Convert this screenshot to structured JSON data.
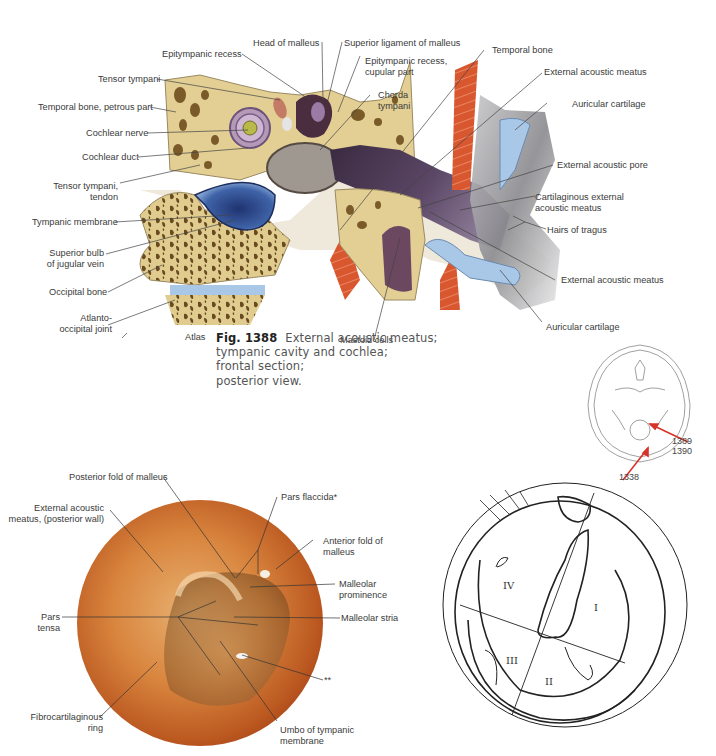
{
  "figure_1388": {
    "number": "Fig. 1388",
    "caption_lines": [
      "External acoustic meatus;",
      "tympanic cavity and cochlea;",
      "frontal section;",
      "posterior view."
    ],
    "labels_left": {
      "tensor_tympani": "Tensor tympani",
      "temporal_bone_petrous": "Temporal bone, petrous part",
      "cochlear_nerve": "Cochlear nerve",
      "cochlear_duct": "Cochlear duct",
      "tensor_tympani_tendon_1": "Tensor tympani,",
      "tensor_tympani_tendon_2": "tendon",
      "tympanic_membrane": "Tympanic membrane",
      "superior_bulb_1": "Superior bulb",
      "superior_bulb_2": "of jugular vein",
      "occipital_bone": "Occipital bone",
      "atlanto_occipital_1": "Atlanto-",
      "atlanto_occipital_2": "occipital joint"
    },
    "labels_top": {
      "epitympanic_recess": "Epitympanic recess",
      "head_of_malleus": "Head of malleus",
      "superior_ligament": "Superior ligament of malleus",
      "epitympanic_cupular_1": "Epitympanic recess,",
      "epitympanic_cupular_2": "cupular part",
      "chorda_tympani_1": "Chorda",
      "chorda_tympani_2": "tympani"
    },
    "labels_right": {
      "temporal_bone": "Temporal bone",
      "external_acoustic_meatus_top": "External acoustic meatus",
      "auricular_cartilage_top": "Auricular cartilage",
      "external_acoustic_pore": "External acoustic pore",
      "cartilaginous_meatus_1": "Cartilaginous external",
      "cartilaginous_meatus_2": "acoustic meatus",
      "hairs_of_tragus": "Hairs of tragus",
      "external_acoustic_meatus_bottom": "External acoustic meatus",
      "auricular_cartilage_bottom": "Auricular cartilage"
    },
    "labels_bottom": {
      "atlas": "Atlas",
      "mastoid_cells": "Mastoid cells"
    }
  },
  "skull_inset": {
    "refs": [
      "1389",
      "1390",
      "1338"
    ],
    "arrow_color": "#d8332a"
  },
  "otoscopy": {
    "labels": {
      "posterior_fold": "Posterior fold of malleus",
      "pars_flaccida": "Pars flaccida*",
      "ext_meatus_1": "External acoustic",
      "ext_meatus_2": "meatus, (posterior wall)",
      "anterior_fold_1": "Anterior fold of",
      "anterior_fold_2": "malleus",
      "malleolar_prominence_1": "Malleolar",
      "malleolar_prominence_2": "prominence",
      "pars_tensa_1": "Pars",
      "pars_tensa_2": "tensa",
      "malleolar_stria": "Malleolar stria",
      "double_star": "**",
      "fibrocartilaginous_1": "Fibrocartilaginous",
      "fibrocartilaginous_2": "ring",
      "umbo_1": "Umbo of tympanic",
      "umbo_2": "membrane"
    }
  },
  "quadrant_diagram": {
    "quadrants": [
      "I",
      "II",
      "III",
      "IV"
    ]
  },
  "colors": {
    "bone": "#e3cf94",
    "muscle": "#d9572f",
    "meatus": "#4e3a52",
    "tympanic_blue": "#3f63a8",
    "cartilage_blue": "#a9c8e8",
    "ear_photo": "#d9863f"
  }
}
